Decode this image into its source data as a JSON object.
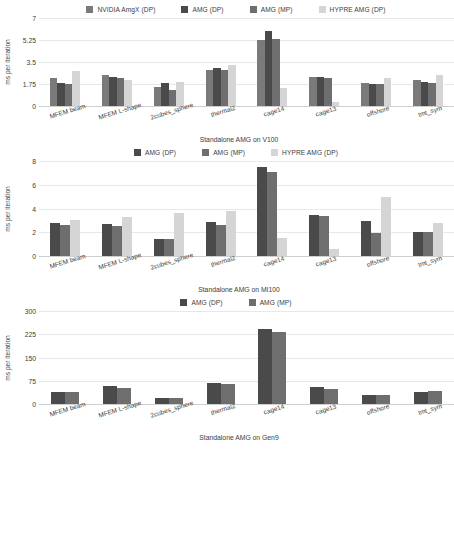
{
  "figure": {
    "kind": "bar-chart-figure",
    "panel_count": 3
  },
  "colors": {
    "series_amgx_dp": "#7a7a7a",
    "series_amg_dp": "#4a4a4a",
    "series_amg_mp": "#6e6e6e",
    "series_hypre_dp": "#d5d5d5",
    "gridline": "#e8e8e8",
    "axis": "#cfcfcf",
    "text": "#3c3c3c",
    "background": "#ffffff"
  },
  "panels": [
    {
      "id": "panel-v100",
      "legend": [
        {
          "label": "NVIDIA AmgX (DP)",
          "color": "#7a7a7a"
        },
        {
          "label": "AMG (DP)",
          "color": "#4a4a4a"
        },
        {
          "label": "AMG (MP)",
          "color": "#6e6e6e"
        },
        {
          "label": "HYPRE AMG (DP)",
          "color": "#d5d5d5"
        }
      ],
      "chart_data": {
        "type": "bar",
        "title": "",
        "xlabel": "Standalone AMG on V100",
        "ylabel": "ms per iteration",
        "ylim": [
          0,
          7
        ],
        "yticks": [
          "0",
          "1.75",
          "3.5",
          "5.25",
          "7"
        ],
        "ytickvals": [
          0,
          1.75,
          3.5,
          5.25,
          7
        ],
        "grid": true,
        "legend_position": "top",
        "categories": [
          "MFEM beam",
          "MFEM L-shape",
          "2cubes_sphere",
          "thermal2",
          "cage14",
          "cage13",
          "offshore",
          "tmt_sym"
        ],
        "series": [
          {
            "name": "NVIDIA AmgX (DP)",
            "color": "#7a7a7a",
            "values": [
              2.25,
              2.45,
              1.55,
              2.85,
              5.25,
              2.3,
              1.8,
              2.05
            ]
          },
          {
            "name": "AMG (DP)",
            "color": "#4a4a4a",
            "values": [
              1.85,
              2.3,
              1.8,
              3.05,
              6.0,
              2.3,
              1.75,
              1.95
            ]
          },
          {
            "name": "AMG (MP)",
            "color": "#6e6e6e",
            "values": [
              1.78,
              2.2,
              1.3,
              2.85,
              5.35,
              2.2,
              1.75,
              1.85
            ]
          },
          {
            "name": "HYPRE AMG (DP)",
            "color": "#d5d5d5",
            "values": [
              2.8,
              2.05,
              1.9,
              3.25,
              1.4,
              0.3,
              2.25,
              2.5
            ]
          }
        ]
      }
    },
    {
      "id": "panel-mi100",
      "legend": [
        {
          "label": "AMG (DP)",
          "color": "#4a4a4a"
        },
        {
          "label": "AMG (MP)",
          "color": "#6e6e6e"
        },
        {
          "label": "HYPRE AMG (DP)",
          "color": "#d5d5d5"
        }
      ],
      "chart_data": {
        "type": "bar",
        "title": "",
        "xlabel": "Standalone AMG on MI100",
        "ylabel": "ms per iteration",
        "ylim": [
          0,
          8
        ],
        "yticks": [
          "0",
          "2",
          "4",
          "6",
          "8"
        ],
        "ytickvals": [
          0,
          2,
          4,
          6,
          8
        ],
        "grid": true,
        "legend_position": "top",
        "categories": [
          "MFEM beam",
          "MFEM L-shape",
          "2cubes_sphere",
          "thermal2",
          "cage14",
          "cage13",
          "offshore",
          "tmt_sym"
        ],
        "series": [
          {
            "name": "AMG (DP)",
            "color": "#4a4a4a",
            "values": [
              2.75,
              2.7,
              1.45,
              2.85,
              7.5,
              3.45,
              2.95,
              2.05
            ]
          },
          {
            "name": "AMG (MP)",
            "color": "#6e6e6e",
            "values": [
              2.6,
              2.55,
              1.4,
              2.65,
              7.05,
              3.35,
              1.95,
              2.0
            ]
          },
          {
            "name": "HYPRE AMG (DP)",
            "color": "#d5d5d5",
            "values": [
              3.0,
              3.3,
              3.6,
              3.8,
              1.5,
              0.6,
              5.0,
              2.8
            ]
          }
        ]
      }
    },
    {
      "id": "panel-gen9",
      "legend": [
        {
          "label": "AMG (DP)",
          "color": "#4a4a4a"
        },
        {
          "label": "AMG (MP)",
          "color": "#6e6e6e"
        }
      ],
      "chart_data": {
        "type": "bar",
        "title": "",
        "xlabel": "Standalone AMG on Gen9",
        "ylabel": "ms per iteration",
        "ylim": [
          0,
          300
        ],
        "yticks": [
          "0",
          "75",
          "150",
          "225",
          "300"
        ],
        "ytickvals": [
          0,
          75,
          150,
          225,
          300
        ],
        "grid": true,
        "legend_position": "top",
        "categories": [
          "MFEM beam",
          "MFEM L-shape",
          "2cubes_sphere",
          "thermal2",
          "cage14",
          "cage13",
          "offshore",
          "tmt_sym"
        ],
        "series": [
          {
            "name": "AMG (DP)",
            "color": "#4a4a4a",
            "values": [
              40,
              57,
              20,
              68,
              243,
              56,
              30,
              38
            ]
          },
          {
            "name": "AMG (MP)",
            "color": "#6e6e6e",
            "values": [
              40,
              51,
              19,
              66,
              231,
              50,
              29,
              43
            ]
          }
        ]
      }
    }
  ]
}
